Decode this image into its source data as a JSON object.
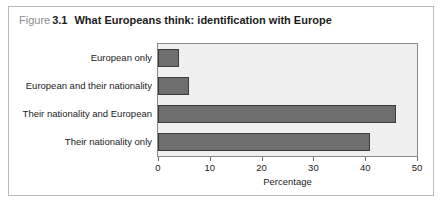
{
  "figure": {
    "label_word": "Figure",
    "number": "3.1",
    "title": "What Europeans think: identification with Europe"
  },
  "colors": {
    "bar_fill": "#6e6e6e",
    "bar_border": "#3d3d3d",
    "plot_background": "#efefef",
    "plot_border": "#8a8a8a",
    "figure_border": "#b9b9b9",
    "caption_muted": "#8c8c8c",
    "text": "#1c1c1c"
  },
  "chart_data": {
    "type": "bar",
    "orientation": "horizontal",
    "title": "What Europeans think: identification with Europe",
    "categories": [
      "European only",
      "European and their nationality",
      "Their nationality and European",
      "Their nationality only"
    ],
    "values": [
      4,
      6,
      46,
      41
    ],
    "xlabel": "Percentage",
    "ylabel": "",
    "xlim": [
      0,
      50
    ],
    "xticks": [
      0,
      10,
      20,
      30,
      40,
      50
    ],
    "xtick_labels": [
      "0",
      "10",
      "20",
      "30",
      "40",
      "50"
    ],
    "grid": false,
    "legend": false
  }
}
